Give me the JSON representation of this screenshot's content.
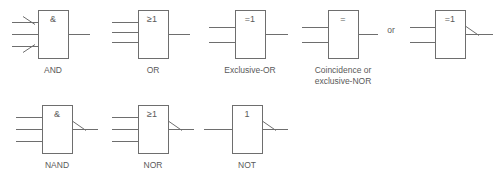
{
  "figure": {
    "line_color": "#6e6e6e",
    "text_color": "#5a5a5a",
    "background": "#ffffff",
    "conjunction": {
      "text": "or",
      "x": 391,
      "y": 33
    }
  },
  "gates": [
    {
      "id": "and",
      "name": "AND gate",
      "symbol": "&",
      "caption_line1": "AND",
      "caption_line2": "",
      "box": {
        "x": 38,
        "y": 10,
        "w": 30,
        "h": 48
      },
      "symbol_pos": {
        "x": 53,
        "y": 22
      },
      "caption_pos": {
        "x": 53,
        "y": 73
      },
      "inputs": [
        {
          "x1": 12,
          "y1": 22,
          "x2": 38,
          "y2": 22,
          "negated": true,
          "slash_dir": "down"
        },
        {
          "x1": 12,
          "y1": 34,
          "x2": 38,
          "y2": 34,
          "negated": false,
          "slash_dir": ""
        },
        {
          "x1": 12,
          "y1": 46,
          "x2": 38,
          "y2": 46,
          "negated": true,
          "slash_dir": "up"
        }
      ],
      "output": {
        "x1": 68,
        "y1": 34,
        "x2": 90,
        "y2": 34,
        "negated": false
      }
    },
    {
      "id": "or",
      "name": "OR gate",
      "symbol": "≥1",
      "caption_line1": "OR",
      "caption_line2": "",
      "box": {
        "x": 138,
        "y": 10,
        "w": 30,
        "h": 48
      },
      "symbol_pos": {
        "x": 152,
        "y": 22
      },
      "caption_pos": {
        "x": 153,
        "y": 73
      },
      "inputs": [
        {
          "x1": 112,
          "y1": 22,
          "x2": 138,
          "y2": 22,
          "negated": false,
          "slash_dir": ""
        },
        {
          "x1": 112,
          "y1": 32,
          "x2": 138,
          "y2": 32,
          "negated": false,
          "slash_dir": ""
        },
        {
          "x1": 112,
          "y1": 42,
          "x2": 138,
          "y2": 42,
          "negated": false,
          "slash_dir": ""
        }
      ],
      "output": {
        "x1": 168,
        "y1": 34,
        "x2": 190,
        "y2": 34,
        "negated": false
      }
    },
    {
      "id": "exclusive-or",
      "name": "Exclusive-OR gate",
      "symbol": "=1",
      "caption_line1": "Exclusive-OR",
      "caption_line2": "",
      "box": {
        "x": 235,
        "y": 10,
        "w": 30,
        "h": 48
      },
      "symbol_pos": {
        "x": 250,
        "y": 22
      },
      "caption_pos": {
        "x": 250,
        "y": 73
      },
      "inputs": [
        {
          "x1": 209,
          "y1": 27,
          "x2": 235,
          "y2": 27,
          "negated": false,
          "slash_dir": ""
        },
        {
          "x1": 209,
          "y1": 42,
          "x2": 235,
          "y2": 42,
          "negated": false,
          "slash_dir": ""
        }
      ],
      "output": {
        "x1": 265,
        "y1": 34,
        "x2": 288,
        "y2": 34,
        "negated": false
      }
    },
    {
      "id": "coincidence",
      "name": "Coincidence or exclusive-NOR gate",
      "symbol": "=",
      "caption_line1": "Coincidence or",
      "caption_line2": "exclusive-NOR",
      "box": {
        "x": 328,
        "y": 10,
        "w": 30,
        "h": 48
      },
      "symbol_pos": {
        "x": 343,
        "y": 22
      },
      "caption_pos": {
        "x": 343,
        "y": 73
      },
      "caption2_pos": {
        "x": 343,
        "y": 84
      },
      "inputs": [
        {
          "x1": 302,
          "y1": 27,
          "x2": 328,
          "y2": 27,
          "negated": false,
          "slash_dir": ""
        },
        {
          "x1": 302,
          "y1": 42,
          "x2": 328,
          "y2": 42,
          "negated": false,
          "slash_dir": ""
        }
      ],
      "output": {
        "x1": 358,
        "y1": 34,
        "x2": 378,
        "y2": 34,
        "negated": false
      }
    },
    {
      "id": "exclusive-nor-alt",
      "name": "Exclusive-NOR gate alternate form",
      "symbol": "=1",
      "caption_line1": "",
      "caption_line2": "",
      "box": {
        "x": 435,
        "y": 10,
        "w": 30,
        "h": 48
      },
      "symbol_pos": {
        "x": 450,
        "y": 22
      },
      "caption_pos": {
        "x": 450,
        "y": 73
      },
      "inputs": [
        {
          "x1": 410,
          "y1": 27,
          "x2": 435,
          "y2": 27,
          "negated": false,
          "slash_dir": ""
        },
        {
          "x1": 410,
          "y1": 42,
          "x2": 435,
          "y2": 42,
          "negated": false,
          "slash_dir": ""
        }
      ],
      "output": {
        "x1": 465,
        "y1": 34,
        "x2": 493,
        "y2": 34,
        "negated": true
      }
    },
    {
      "id": "nand",
      "name": "NAND gate",
      "symbol": "&",
      "caption_line1": "NAND",
      "caption_line2": "",
      "box": {
        "x": 42,
        "y": 105,
        "w": 30,
        "h": 48
      },
      "symbol_pos": {
        "x": 57,
        "y": 117
      },
      "caption_pos": {
        "x": 57,
        "y": 168
      },
      "inputs": [
        {
          "x1": 16,
          "y1": 117,
          "x2": 42,
          "y2": 117,
          "negated": false,
          "slash_dir": ""
        },
        {
          "x1": 16,
          "y1": 129,
          "x2": 42,
          "y2": 129,
          "negated": false,
          "slash_dir": ""
        },
        {
          "x1": 16,
          "y1": 141,
          "x2": 42,
          "y2": 141,
          "negated": false,
          "slash_dir": ""
        }
      ],
      "output": {
        "x1": 72,
        "y1": 129,
        "x2": 98,
        "y2": 129,
        "negated": true
      }
    },
    {
      "id": "nor",
      "name": "NOR gate",
      "symbol": "≥1",
      "caption_line1": "NOR",
      "caption_line2": "",
      "box": {
        "x": 138,
        "y": 105,
        "w": 30,
        "h": 48
      },
      "symbol_pos": {
        "x": 152,
        "y": 117
      },
      "caption_pos": {
        "x": 153,
        "y": 168
      },
      "inputs": [
        {
          "x1": 112,
          "y1": 117,
          "x2": 138,
          "y2": 117,
          "negated": false,
          "slash_dir": ""
        },
        {
          "x1": 112,
          "y1": 129,
          "x2": 138,
          "y2": 129,
          "negated": false,
          "slash_dir": ""
        },
        {
          "x1": 112,
          "y1": 141,
          "x2": 138,
          "y2": 141,
          "negated": false,
          "slash_dir": ""
        }
      ],
      "output": {
        "x1": 168,
        "y1": 129,
        "x2": 194,
        "y2": 129,
        "negated": true
      }
    },
    {
      "id": "not",
      "name": "NOT gate",
      "symbol": "1",
      "caption_line1": "NOT",
      "caption_line2": "",
      "box": {
        "x": 232,
        "y": 105,
        "w": 30,
        "h": 48
      },
      "symbol_pos": {
        "x": 247,
        "y": 117
      },
      "caption_pos": {
        "x": 247,
        "y": 168
      },
      "inputs": [
        {
          "x1": 204,
          "y1": 129,
          "x2": 232,
          "y2": 129,
          "negated": false,
          "slash_dir": ""
        }
      ],
      "output": {
        "x1": 262,
        "y1": 129,
        "x2": 288,
        "y2": 129,
        "negated": true
      }
    }
  ]
}
